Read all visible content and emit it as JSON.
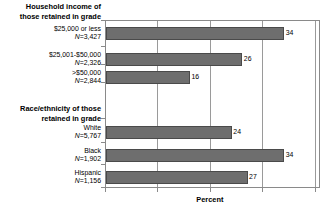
{
  "chart_data": {
    "type": "bar",
    "orientation": "horizontal",
    "title": "",
    "xlabel": "Percent",
    "ylabel": "",
    "xlim": [
      0,
      41
    ],
    "grid": true,
    "gridline_values": [
      0,
      10,
      20,
      30,
      40
    ],
    "tick_labels_visible": false,
    "legend": null,
    "bar_color": "#6e6e6e",
    "bar_edge_color": "#4a4a4a",
    "groups": [
      {
        "header": "Household income of those retained in grade",
        "header_lines": [
          "Household income of",
          "those retained in grade"
        ],
        "items": [
          {
            "label": "$25,000 or less",
            "n_text": "N=3,427",
            "n": 3427,
            "value": 34,
            "value_label": "34"
          },
          {
            "label": "$25,001-$50,000",
            "n_text": "N=2,326",
            "n": 2326,
            "value": 26,
            "value_label": "26"
          },
          {
            "label": ">$50,000",
            "n_text": "N=2,844",
            "n": 2844,
            "value": 16,
            "value_label": "16"
          }
        ]
      },
      {
        "header": "Race/ethnicity of those retained in grade",
        "header_lines": [
          "Race/ethnicity of those",
          "retained in grade"
        ],
        "items": [
          {
            "label": "White",
            "n_text": "N=5,767",
            "n": 5767,
            "value": 24,
            "value_label": "24"
          },
          {
            "label": "Black",
            "n_text": "N=1,902",
            "n": 1902,
            "value": 34,
            "value_label": "34"
          },
          {
            "label": "Hispanic",
            "n_text": "N=1,156",
            "n": 1156,
            "value": 27,
            "value_label": "27"
          }
        ]
      }
    ],
    "categories": [
      "$25,000 or less",
      "$25,001-$50,000",
      ">$50,000",
      "White",
      "Black",
      "Hispanic"
    ],
    "values": [
      34,
      26,
      16,
      24,
      34,
      27
    ]
  },
  "layout": {
    "group_headers": [
      {
        "lines": [
          "Household income of",
          "those retained in grade"
        ],
        "top": 2
      },
      {
        "lines": [
          "Race/ethnicity of those",
          "retained in grade"
        ],
        "top": 104
      }
    ],
    "bars": [
      {
        "top": 26,
        "value": 34,
        "n_text": "N=3,427",
        "label": "$25,000 or less",
        "label_top": 25
      },
      {
        "top": 52,
        "value": 26,
        "n_text": "N=2,326",
        "label": "$25,001-$50,000",
        "label_top": 51
      },
      {
        "top": 70,
        "value": 16,
        "n_text": "N=2,844",
        "label": ">$50,000",
        "label_top": 69
      },
      {
        "top": 125,
        "value": 24,
        "n_text": "N=5,767",
        "label": "White",
        "label_top": 124
      },
      {
        "top": 148,
        "value": 34,
        "n_text": "N=1,902",
        "label": "Black",
        "label_top": 147
      },
      {
        "top": 170,
        "value": 27,
        "n_text": "N=1,156",
        "label": "Hispanic",
        "label_top": 169
      }
    ],
    "ytick_tops": [
      20,
      46,
      64,
      82,
      118,
      142,
      164,
      187
    ]
  }
}
